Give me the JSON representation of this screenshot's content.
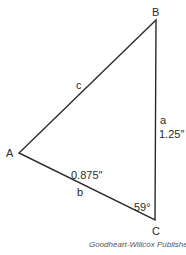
{
  "diagram": {
    "type": "triangle",
    "vertices": {
      "A": {
        "label": "A"
      },
      "B": {
        "label": "B"
      },
      "C": {
        "label": "C"
      }
    },
    "sides": {
      "a": {
        "label": "a",
        "length": "1.25″"
      },
      "b": {
        "label": "b",
        "length": "0.875″"
      },
      "c": {
        "label": "c"
      }
    },
    "angles": {
      "C": {
        "value": "59°"
      }
    },
    "credit": "Goodheart-Willcox Publisher",
    "line_color": "#2a2a2a"
  }
}
